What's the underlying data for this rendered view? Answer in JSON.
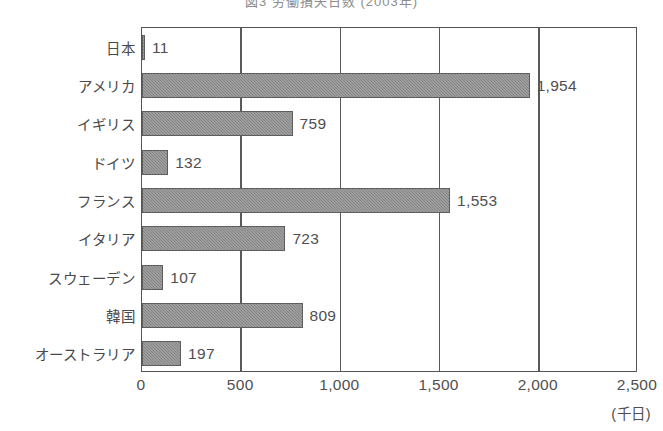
{
  "chart_data": {
    "type": "bar",
    "orientation": "horizontal",
    "title": "図3 労働損失日数 (2003年)",
    "categories": [
      "日本",
      "アメリカ",
      "イギリス",
      "ドイツ",
      "フランス",
      "イタリア",
      "スウェーデン",
      "韓国",
      "オーストラリア"
    ],
    "values": [
      11,
      1954,
      759,
      132,
      1553,
      723,
      107,
      809,
      197
    ],
    "value_labels": [
      "11",
      "1,954",
      "759",
      "132",
      "1,553",
      "723",
      "107",
      "809",
      "197"
    ],
    "xlabel": "",
    "ylabel": "",
    "unit_label": "(千日)",
    "xlim": [
      0,
      2500
    ],
    "xticks": [
      0,
      500,
      1000,
      1500,
      2000,
      2500
    ],
    "xtick_labels": [
      "0",
      "500",
      "1,000",
      "1,500",
      "2,000",
      "2,500"
    ],
    "grid": true,
    "legend": null,
    "bar_color": "#8c8c8c",
    "bar_edge_color": "#5d5d5d",
    "axis_color": "#555555",
    "text_color": "#4f4f4f",
    "background": "#ffffff"
  }
}
